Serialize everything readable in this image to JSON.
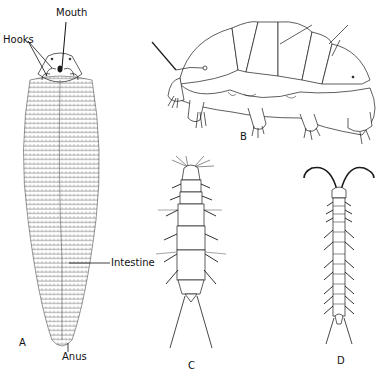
{
  "figure": {
    "panels": [
      {
        "id": "A",
        "label": "A",
        "subject": "pentastomid-like worm, ventral view"
      },
      {
        "id": "B",
        "label": "B",
        "subject": "tardigrade, lateral view"
      },
      {
        "id": "C",
        "label": "C",
        "subject": "dipluran, dorsal view"
      },
      {
        "id": "D",
        "label": "D",
        "subject": "symphylan, dorsal view"
      }
    ],
    "annotations": {
      "mouth": "Mouth",
      "hooks": "Hooks",
      "intestine": "Intestine",
      "anus": "Anus"
    },
    "colors": {
      "ink": "#1a1a1a",
      "background": "#ffffff"
    }
  }
}
